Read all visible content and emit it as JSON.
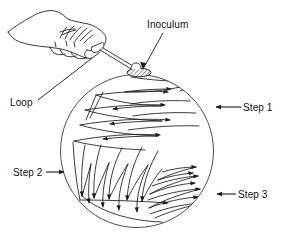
{
  "figure": {
    "background_color": "#ffffff",
    "ink_color": "#1a1a1a",
    "labels": {
      "inoculum": "Inoculum",
      "loop": "Loop",
      "step1": "Step 1",
      "step2": "Step 2",
      "step3": "Step 3"
    },
    "elements": {
      "petri_dish": "agar-plate-circle",
      "hand": "hand-holding-loop",
      "loop_tool": "inoculating-loop",
      "inoculum_blob": "hatched-inoculum-oval",
      "step1_streaks": "horizontal-zigzag-streaks-upper",
      "step2_streaks": "vertical-zigzag-streaks-lower-left",
      "step3_streaks": "curved-streaks-lower-right"
    },
    "icons": {
      "pointer_step1": "arrow-left-icon",
      "pointer_step2": "arrow-right-icon",
      "pointer_step3": "arrow-left-icon",
      "pointer_inoculum": "leader-line",
      "pointer_loop": "leader-line"
    }
  }
}
